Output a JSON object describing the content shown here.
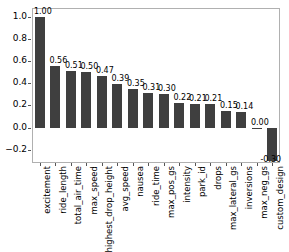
{
  "chart_data": {
    "type": "bar",
    "title": "",
    "subtitle": "",
    "xlabel": "",
    "ylabel": "",
    "grid": false,
    "legend": false,
    "ylim": [
      -0.32,
      1.08
    ],
    "ytick_labels": [
      "1.0",
      "0.8",
      "0.6",
      "0.4",
      "0.2",
      "0.0",
      "−0.2"
    ],
    "ytick_values": [
      1.0,
      0.8,
      0.6,
      0.4,
      0.2,
      0.0,
      -0.2
    ],
    "categories": [
      "excitement",
      "ride_length",
      "total_air_time",
      "max_speed",
      "highest_drop_height",
      "avg_speed",
      "nausea",
      "ride_time",
      "max_pos_gs",
      "intensity",
      "park_id",
      "drops",
      "max_lateral_gs",
      "inversions",
      "max_neg_gs",
      "custom_design"
    ],
    "values": [
      1.0,
      0.56,
      0.51,
      0.5,
      0.47,
      0.39,
      0.35,
      0.31,
      0.3,
      0.22,
      0.21,
      0.21,
      0.15,
      0.14,
      0.0,
      -0.3
    ],
    "value_labels": [
      "1.00",
      "0.56",
      "0.51",
      "0.50",
      "0.47",
      "0.39",
      "0.35",
      "0.31",
      "0.30",
      "0.22",
      "0.21",
      "0.21",
      "0.15",
      "0.14",
      "0.00",
      "-0.30"
    ],
    "bar_color": "#3f3f3f",
    "axes_color": "#b0b0b0",
    "text_color": "#000000"
  }
}
